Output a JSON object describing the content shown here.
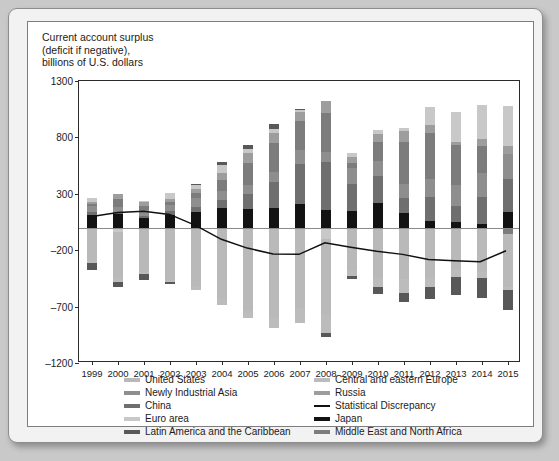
{
  "chart": {
    "title": "Current account surplus\n(deficit if negative),\nbillions of U.S. dollars"
  },
  "legend": {
    "items": [
      {
        "label": "United States",
        "color": "#b9b9b9"
      },
      {
        "label": "Central and eastern Europe",
        "color": "#bcbcbc"
      },
      {
        "label": "Newly Industrial Asia",
        "color": "#8e8e8e"
      },
      {
        "label": "Russia",
        "color": "#9d9d9d"
      },
      {
        "label": "China",
        "color": "#6f6f6f"
      },
      {
        "label": "Statistical Discrepancy",
        "color": "#111111"
      },
      {
        "label": "Euro area",
        "color": "#c8c8c8"
      },
      {
        "label": "Japan",
        "color": "#121212"
      },
      {
        "label": "Latin America and the Caribbean",
        "color": "#585858"
      },
      {
        "label": "Middle East and North Africa",
        "color": "#7c7c7c"
      }
    ]
  },
  "chart_data": {
    "type": "bar",
    "stacked": true,
    "title": "Current account surplus (deficit if negative), billions of U.S. dollars",
    "xlabel": "",
    "ylabel": "billions of U.S. dollars",
    "ylim": [
      -1200,
      1300
    ],
    "yticks": [
      1300,
      800,
      300,
      -200,
      -700,
      -1200
    ],
    "grid": false,
    "legend_position": "bottom",
    "categories": [
      "1999",
      "2000",
      "2001",
      "2002",
      "2003",
      "2004",
      "2005",
      "2006",
      "2007",
      "2008",
      "2009",
      "2010",
      "2011",
      "2012",
      "2013",
      "2014",
      "2015"
    ],
    "series": [
      {
        "name": "Japan",
        "color": "#121212",
        "values": [
          115,
          120,
          88,
          112,
          136,
          172,
          166,
          171,
          212,
          159,
          146,
          221,
          129,
          60,
          46,
          36,
          136
        ]
      },
      {
        "name": "China",
        "color": "#6f6f6f",
        "values": [
          21,
          20,
          17,
          35,
          43,
          69,
          134,
          232,
          353,
          421,
          243,
          238,
          136,
          215,
          148,
          236,
          293
        ]
      },
      {
        "name": "Newly Industrial Asia",
        "color": "#8e8e8e",
        "values": [
          60,
          41,
          47,
          57,
          82,
          84,
          80,
          92,
          124,
          87,
          136,
          135,
          122,
          154,
          186,
          214,
          228
        ]
      },
      {
        "name": "Middle East and North Africa",
        "color": "#7c7c7c",
        "values": [
          12,
          72,
          42,
          24,
          48,
          96,
          195,
          252,
          260,
          348,
          47,
          166,
          369,
          406,
          350,
          239,
          -60
        ]
      },
      {
        "name": "Russia",
        "color": "#9d9d9d",
        "values": [
          22,
          46,
          33,
          29,
          35,
          59,
          84,
          94,
          72,
          104,
          50,
          67,
          97,
          71,
          33,
          58,
          69
        ]
      },
      {
        "name": "Euro area",
        "color": "#c8c8c8",
        "values": [
          36,
          -37,
          5,
          47,
          39,
          78,
          36,
          34,
          20,
          -97,
          39,
          38,
          34,
          161,
          260,
          300,
          350
        ]
      },
      {
        "name": "United States",
        "color": "#b9b9b9",
        "values": [
          -290,
          -410,
          -393,
          -460,
          -520,
          -630,
          -740,
          -800,
          -713,
          -681,
          -381,
          -444,
          -459,
          -448,
          -367,
          -392,
          -463
        ]
      },
      {
        "name": "Central and eastern Europe",
        "color": "#bcbcbc",
        "values": [
          -26,
          -32,
          -16,
          -24,
          -37,
          -59,
          -62,
          -89,
          -136,
          -155,
          -48,
          -82,
          -119,
          -80,
          -70,
          -52,
          -30
        ]
      },
      {
        "name": "Latin America and the Caribbean",
        "color": "#585858",
        "values": [
          -56,
          -48,
          -54,
          -16,
          8,
          21,
          35,
          48,
          13,
          -38,
          -28,
          -60,
          -77,
          -103,
          -163,
          -180,
          -180
        ]
      },
      {
        "name": "Statistical Discrepancy",
        "color": "#111111",
        "type": "line",
        "values": [
          94,
          128,
          139,
          112,
          14,
          -110,
          -188,
          -240,
          -244,
          -140,
          -180,
          -216,
          -244,
          -290,
          -300,
          -310,
          -212
        ]
      }
    ]
  }
}
